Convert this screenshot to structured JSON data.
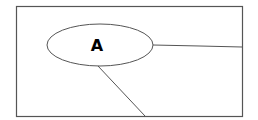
{
  "diagram": {
    "type": "tree-diagram",
    "frame": {
      "x": 16,
      "y": 6,
      "width": 226,
      "height": 110,
      "stroke": "#555555"
    },
    "nodes": [
      {
        "id": "A",
        "label": "A",
        "shape": "ellipse",
        "cx": 100,
        "cy": 45,
        "rx": 53,
        "ry": 21,
        "stroke": "#555555",
        "fill": "#ffffff"
      }
    ],
    "edges": [
      {
        "from": "A",
        "to": "right-edge",
        "points": [
          [
            153,
            45
          ],
          [
            200,
            46
          ],
          [
            242,
            47
          ]
        ],
        "stroke": "#555555"
      },
      {
        "from": "A",
        "to": "bottom-edge",
        "points": [
          [
            98,
            66
          ],
          [
            145,
            116
          ]
        ],
        "stroke": "#555555"
      }
    ],
    "colors": {
      "background": "#ffffff",
      "line": "#555555",
      "text": "#000000"
    }
  }
}
